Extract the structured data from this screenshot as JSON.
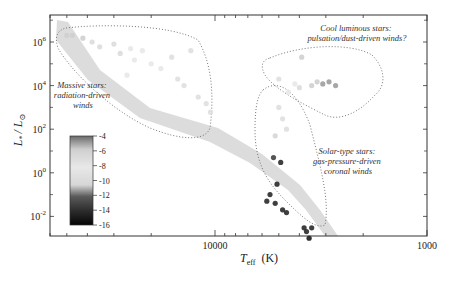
{
  "chart_data": {
    "type": "scatter",
    "title": "",
    "xlabel": "T_eff (K)",
    "xlabel_main": "T",
    "xlabel_sub": "eff",
    "xlabel_unit": "(K)",
    "ylabel": "L* / L⊙",
    "ylabel_main": "L",
    "ylabel_sub": "*",
    "ylabel_den": "/ L",
    "ylabel_den_sub": "⊙",
    "xscale": "log",
    "yscale": "log",
    "x_reversed": true,
    "xlim": [
      60000,
      1000
    ],
    "ylim": [
      0.001,
      10000000
    ],
    "x_ticks": [
      {
        "value": 10000,
        "label": "10000"
      },
      {
        "value": 1000,
        "label": "1000"
      }
    ],
    "y_ticks": [
      {
        "value": 1000000,
        "base": "10",
        "exp": "6"
      },
      {
        "value": 10000,
        "base": "10",
        "exp": "4"
      },
      {
        "value": 100,
        "base": "10",
        "exp": "2"
      },
      {
        "value": 1,
        "base": "10",
        "exp": "0"
      },
      {
        "value": 0.01,
        "base": "10",
        "exp": "-2"
      }
    ],
    "grid": false,
    "colorbar": {
      "label": "log mass-loss rate",
      "ticks": [
        "-4",
        "-6",
        "-8",
        "-10",
        "-12",
        "-14",
        "-16"
      ],
      "range": [
        -4,
        -16
      ],
      "colors": [
        "#6a6a6a",
        "#cfcfcf",
        "#e6e6e6",
        "#d8d8d8",
        "#5a5a5a",
        "#2a2a2a",
        "#050505"
      ]
    },
    "annotations": [
      {
        "id": "massive",
        "lines": [
          "Massive stars:",
          "radiation-driven",
          "winds"
        ]
      },
      {
        "id": "cool",
        "lines": [
          "Cool luminous stars:",
          "pulsation/dust-driven winds?"
        ]
      },
      {
        "id": "solar",
        "lines": [
          "Solar-type stars:",
          "gas-pressure-driven",
          "coronal winds"
        ]
      }
    ],
    "regions": [
      "massive-stars",
      "cool-luminous-stars",
      "solar-type-stars",
      "main-sequence-band"
    ],
    "series": [
      {
        "name": "Massive stars",
        "points": [
          {
            "T": 50000,
            "L": 2000000,
            "c": -6
          },
          {
            "T": 47000,
            "L": 2000000,
            "c": -6
          },
          {
            "T": 42000,
            "L": 1500000,
            "c": -6
          },
          {
            "T": 38000,
            "L": 1000000,
            "c": -7
          },
          {
            "T": 35000,
            "L": 600000,
            "c": -7
          },
          {
            "T": 30000,
            "L": 800000,
            "c": -7
          },
          {
            "T": 28000,
            "L": 300000,
            "c": -7
          },
          {
            "T": 25000,
            "L": 500000,
            "c": -8
          },
          {
            "T": 24000,
            "L": 150000,
            "c": -8
          },
          {
            "T": 22000,
            "L": 400000,
            "c": -8
          },
          {
            "T": 20000,
            "L": 100000,
            "c": -8
          },
          {
            "T": 18000,
            "L": 60000,
            "c": -8
          },
          {
            "T": 26000,
            "L": 30000,
            "c": -8
          },
          {
            "T": 16000,
            "L": 200000,
            "c": -9
          },
          {
            "T": 15000,
            "L": 20000,
            "c": -9
          },
          {
            "T": 14000,
            "L": 10000,
            "c": -9
          },
          {
            "T": 12000,
            "L": 3000,
            "c": -9
          },
          {
            "T": 11000,
            "L": 1500,
            "c": -9
          },
          {
            "T": 10500,
            "L": 600,
            "c": -9
          },
          {
            "T": 13000,
            "L": 400000,
            "c": -9
          }
        ]
      },
      {
        "name": "Cool luminous stars",
        "points": [
          {
            "T": 3500,
            "L": 10000,
            "c": -6
          },
          {
            "T": 3300,
            "L": 15000,
            "c": -6
          },
          {
            "T": 3100,
            "L": 12000,
            "c": -5
          },
          {
            "T": 2900,
            "L": 15000,
            "c": -5
          },
          {
            "T": 2700,
            "L": 10000,
            "c": -5
          },
          {
            "T": 4000,
            "L": 8000,
            "c": -7
          },
          {
            "T": 4200,
            "L": 12000,
            "c": -8
          },
          {
            "T": 4500,
            "L": 5000,
            "c": -8
          },
          {
            "T": 5000,
            "L": 20000,
            "c": -9
          },
          {
            "T": 3900,
            "L": 200000,
            "c": -6
          }
        ]
      },
      {
        "name": "Solar-type stars",
        "points": [
          {
            "T": 5000,
            "L": 1000,
            "c": -9
          },
          {
            "T": 4800,
            "L": 300,
            "c": -9
          },
          {
            "T": 4600,
            "L": 100,
            "c": -9
          },
          {
            "T": 5200,
            "L": 50,
            "c": -10
          },
          {
            "T": 5300,
            "L": 5,
            "c": -13
          },
          {
            "T": 4900,
            "L": 3,
            "c": -14
          },
          {
            "T": 5100,
            "L": 0.3,
            "c": -14
          },
          {
            "T": 5700,
            "L": 0.05,
            "c": -14
          },
          {
            "T": 5500,
            "L": 0.1,
            "c": -14
          },
          {
            "T": 5200,
            "L": 0.04,
            "c": -14
          },
          {
            "T": 4800,
            "L": 0.02,
            "c": -14
          },
          {
            "T": 4600,
            "L": 0.015,
            "c": -14
          },
          {
            "T": 3800,
            "L": 0.003,
            "c": -14
          },
          {
            "T": 3500,
            "L": 0.003,
            "c": -14
          },
          {
            "T": 3700,
            "L": 0.002,
            "c": -14
          },
          {
            "T": 3600,
            "L": 0.001,
            "c": -15
          }
        ]
      }
    ]
  }
}
